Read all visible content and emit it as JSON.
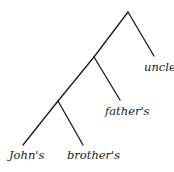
{
  "diagram": {
    "type": "syntax-tree",
    "line_color": "#1a1a1a",
    "nodes": [
      {
        "id": "root",
        "x": 128,
        "y": 12
      },
      {
        "id": "mid",
        "x": 94,
        "y": 57
      },
      {
        "id": "low",
        "x": 58,
        "y": 101
      }
    ],
    "edges": [
      {
        "from": [
          128,
          12
        ],
        "to": [
          154,
          56
        ]
      },
      {
        "from": [
          128,
          12
        ],
        "to": [
          94,
          57
        ]
      },
      {
        "from": [
          94,
          57
        ],
        "to": [
          120,
          100
        ]
      },
      {
        "from": [
          94,
          57
        ],
        "to": [
          58,
          101
        ]
      },
      {
        "from": [
          58,
          101
        ],
        "to": [
          83,
          145
        ]
      },
      {
        "from": [
          58,
          101
        ],
        "to": [
          23,
          145
        ]
      }
    ],
    "leaves": [
      {
        "text": "John's",
        "x": 9,
        "y": 150
      },
      {
        "text": "brother's",
        "x": 67,
        "y": 150
      },
      {
        "text": "father's",
        "x": 105,
        "y": 106
      },
      {
        "text": "uncle",
        "x": 144,
        "y": 62
      }
    ]
  }
}
